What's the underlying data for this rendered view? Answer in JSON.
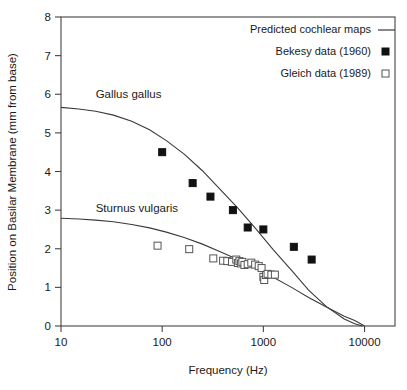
{
  "chart_data": {
    "type": "scatter",
    "title": "",
    "xlabel": "Frequency (Hz)",
    "ylabel": "Position on Basilar Membrane (mm from base)",
    "xscale": "log",
    "yscale": "linear",
    "xlim": [
      10,
      20000
    ],
    "ylim": [
      0,
      8
    ],
    "grid": false,
    "xticks": [
      10,
      100,
      1000,
      10000
    ],
    "xtick_labels": [
      "10",
      "100",
      "1000",
      "10000"
    ],
    "yticks": [
      0,
      1,
      2,
      3,
      4,
      5,
      6,
      7,
      8
    ],
    "ytick_labels": [
      "0",
      "1",
      "2",
      "3",
      "4",
      "5",
      "6",
      "7",
      "8"
    ],
    "legend_position": "top-right",
    "legend": [
      {
        "label": "Predicted cochlear maps",
        "marker": "line"
      },
      {
        "label": "Bekesy data (1960)",
        "marker": "filled-square"
      },
      {
        "label": "Gleich data (1989)",
        "marker": "open-square"
      }
    ],
    "annotations": [
      {
        "text": "Gallus gallus",
        "x": 22,
        "y": 6.0
      },
      {
        "text": "Sturnus vulgaris",
        "x": 22,
        "y": 3.05
      }
    ],
    "series": [
      {
        "name": "Gallus gallus predicted cochlear map",
        "type": "line",
        "x": [
          10,
          15,
          22,
          33,
          50,
          75,
          110,
          165,
          250,
          370,
          560,
          840,
          1250,
          1900,
          2800,
          4200,
          6300,
          8000,
          9500
        ],
        "y": [
          5.66,
          5.62,
          5.56,
          5.46,
          5.3,
          5.08,
          4.8,
          4.45,
          4.02,
          3.55,
          3.05,
          2.52,
          1.98,
          1.44,
          0.93,
          0.5,
          0.18,
          0.06,
          0.0
        ]
      },
      {
        "name": "Sturnus vulgaris predicted cochlear map",
        "type": "line",
        "x": [
          10,
          15,
          22,
          33,
          50,
          75,
          110,
          165,
          250,
          370,
          560,
          840,
          1250,
          1900,
          2800,
          4200,
          6300,
          8000,
          10000
        ],
        "y": [
          2.79,
          2.77,
          2.74,
          2.7,
          2.63,
          2.54,
          2.43,
          2.29,
          2.12,
          1.93,
          1.72,
          1.5,
          1.26,
          1.0,
          0.74,
          0.49,
          0.25,
          0.14,
          0.0
        ]
      },
      {
        "name": "Bekesy data (1960)",
        "type": "scatter",
        "marker": "filled-square",
        "x": [
          100,
          200,
          300,
          500,
          700,
          1000,
          2000,
          3000
        ],
        "y": [
          4.5,
          3.7,
          3.35,
          3.0,
          2.55,
          2.5,
          2.05,
          1.72
        ]
      },
      {
        "name": "Gleich data (1989)",
        "type": "scatter",
        "marker": "open-square",
        "x": [
          90,
          185,
          320,
          400,
          440,
          490,
          540,
          560,
          580,
          600,
          620,
          650,
          700,
          760,
          830,
          900,
          960,
          1000,
          1020,
          1060,
          1100,
          1200,
          1300
        ],
        "y": [
          2.08,
          1.99,
          1.75,
          1.69,
          1.68,
          1.66,
          1.72,
          1.63,
          1.68,
          1.62,
          1.66,
          1.58,
          1.6,
          1.64,
          1.59,
          1.55,
          1.5,
          1.27,
          1.19,
          1.32,
          1.35,
          1.33,
          1.33
        ]
      }
    ]
  },
  "colors": {
    "curve": "#3a3a3a",
    "axis": "#444444",
    "filled_marker": "#111111",
    "open_marker_stroke": "#555555",
    "background": "#ffffff"
  }
}
